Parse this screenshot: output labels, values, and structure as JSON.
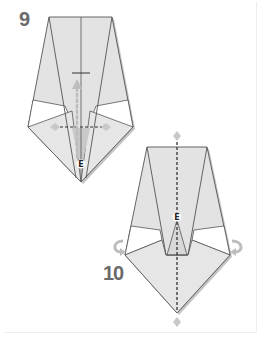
{
  "diagram": {
    "type": "origami-instructions",
    "steps": [
      {
        "number": "9",
        "point_label": "E",
        "annotations": [
          "valley-fold-line",
          "fold-up-arrow",
          "crease-tick",
          "fold-end-diamonds"
        ]
      },
      {
        "number": "10",
        "point_label": "E",
        "annotations": [
          "mountain-fold-center-line",
          "turn-over-arrows",
          "fold-end-diamonds"
        ]
      }
    ]
  },
  "colors": {
    "paper": "#e3e3e3",
    "paper_shadow": "#b8b8b8",
    "white_band": "#ffffff",
    "line": "#555555",
    "arrow": "#bdbdbd",
    "step_number": "#6a6a6a",
    "dashed": "#333333",
    "inner_triangle": "#c8c8c8"
  }
}
